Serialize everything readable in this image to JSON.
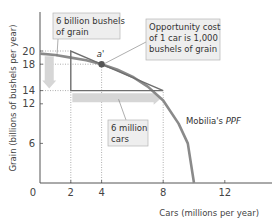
{
  "chart_data": {
    "type": "line",
    "title": "",
    "xlabel": "Cars (millions per year)",
    "ylabel": "Grain (billions of bushels per year)",
    "xlim": [
      0,
      15
    ],
    "ylim": [
      0,
      23
    ],
    "x_ticks": [
      0,
      2,
      4,
      8,
      12
    ],
    "y_ticks": [
      6,
      12,
      14,
      18,
      20
    ],
    "grid": false,
    "series": [
      {
        "name": "Mobilia's PPF",
        "label_prefix": "Mobilia's ",
        "label_italic": "PPF",
        "points": [
          [
            0,
            19.6
          ],
          [
            1,
            19.4
          ],
          [
            2,
            19.0
          ],
          [
            3,
            18.6
          ],
          [
            4,
            18.0
          ],
          [
            5,
            17.2
          ],
          [
            6,
            16.1
          ],
          [
            7,
            14.6
          ],
          [
            8,
            12.5
          ],
          [
            9,
            9.0
          ],
          [
            9.6,
            6.0
          ],
          [
            10,
            0
          ]
        ],
        "color": "#8a8a8a"
      }
    ],
    "points": [
      {
        "label": "a'",
        "x": 4,
        "y": 18,
        "color": "#555555"
      }
    ],
    "triangle": {
      "vertices": [
        [
          2,
          20
        ],
        [
          2,
          14
        ],
        [
          8,
          14
        ]
      ],
      "color": "#6e6e6e"
    },
    "reference_lines": [
      {
        "axis": "y",
        "value": 20,
        "from_x": 0,
        "to_x": 2
      },
      {
        "axis": "y",
        "value": 18,
        "from_x": 0,
        "to_x": 4
      },
      {
        "axis": "y",
        "value": 14,
        "from_x": 0,
        "to_x": 2
      },
      {
        "axis": "x",
        "value": 2,
        "from_y": 0,
        "to_y": 14
      },
      {
        "axis": "x",
        "value": 4,
        "from_y": 0,
        "to_y": 18
      },
      {
        "axis": "x",
        "value": 8,
        "from_y": 0,
        "to_y": 14
      }
    ],
    "arrows": [
      {
        "name": "grain-decrease-arrow",
        "from": [
          0.6,
          19.2
        ],
        "to": [
          0.6,
          14.3
        ],
        "color": "#d6d6d6"
      },
      {
        "name": "cars-increase-arrow",
        "from": [
          2.1,
          12.9
        ],
        "to": [
          7.9,
          12.9
        ],
        "color": "#d6d6d6"
      }
    ],
    "annotations": [
      {
        "name": "grain-callout",
        "lines": [
          "6 billion bushels",
          "of grain"
        ],
        "points_to": [
          1.1,
          19.2
        ]
      },
      {
        "name": "opportunity-cost-callout",
        "lines": [
          "Opportunity cost",
          "of 1 car is 1,000",
          "bushels of grain"
        ],
        "points_to": [
          4.2,
          18.1
        ]
      },
      {
        "name": "cars-callout",
        "lines": [
          "6 million",
          "cars"
        ],
        "points_to": [
          5.1,
          12.7
        ]
      }
    ],
    "colors": {
      "axis": "#555555",
      "ppf": "#8a8a8a",
      "triangle": "#6e6e6e",
      "arrow": "#d6d6d6",
      "callout_bg": "#eeeeee",
      "callout_border": "#b5b5b5",
      "dotted": "#999999"
    }
  }
}
